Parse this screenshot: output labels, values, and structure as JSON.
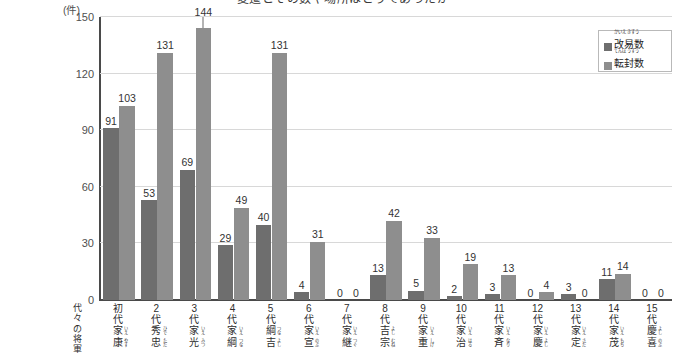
{
  "title": "変遷とその数や場所はどうであったか",
  "axis": {
    "y_unit": "(件)",
    "y_ticks": [
      "0",
      "30",
      "60",
      "90",
      "120",
      "150"
    ],
    "x_axis_name_lines": [
      "代々の将軍"
    ]
  },
  "legend": {
    "items": [
      {
        "ruby": "かいえきすう",
        "label": "改易数",
        "color": "#6e6e6e"
      },
      {
        "ruby": "てんぽうすう",
        "label": "転封数",
        "color": "#8e8e8e"
      }
    ]
  },
  "chart_data": {
    "type": "bar",
    "title": "変遷とその数や場所はどうであったか",
    "xlabel": "代々の将軍",
    "ylabel": "(件)",
    "ylim": [
      0,
      150
    ],
    "yticks": [
      0,
      30,
      60,
      90,
      120,
      150
    ],
    "grid": true,
    "legend_position": "top-right",
    "categories": [
      "初代 家康",
      "2代 秀忠",
      "3代 家光",
      "4代 家綱",
      "5代 綱吉",
      "6代 家宣",
      "7代 家継",
      "8代 吉宗",
      "9代 家重",
      "10代 家治",
      "11代 家斉",
      "12代 家慶",
      "13代 家定",
      "14代 家茂",
      "15代 慶喜"
    ],
    "category_details": [
      {
        "gen": "初代",
        "gen_ruby": "しょだい",
        "name": "家康",
        "name_ruby": "いえやす"
      },
      {
        "gen": "2代",
        "gen_ruby": "だい",
        "name": "秀忠",
        "name_ruby": "ひでただ"
      },
      {
        "gen": "3代",
        "gen_ruby": "だい",
        "name": "家光",
        "name_ruby": "いえみつ"
      },
      {
        "gen": "4代",
        "gen_ruby": "だい",
        "name": "家綱",
        "name_ruby": "いえつな"
      },
      {
        "gen": "5代",
        "gen_ruby": "だい",
        "name": "綱吉",
        "name_ruby": "つなよし"
      },
      {
        "gen": "6代",
        "gen_ruby": "だい",
        "name": "家宣",
        "name_ruby": "いえのぶ"
      },
      {
        "gen": "7代",
        "gen_ruby": "だい",
        "name": "家継",
        "name_ruby": "いえつぐ"
      },
      {
        "gen": "8代",
        "gen_ruby": "だい",
        "name": "吉宗",
        "name_ruby": "よしむね"
      },
      {
        "gen": "9代",
        "gen_ruby": "だい",
        "name": "家重",
        "name_ruby": "いえしげ"
      },
      {
        "gen": "10代",
        "gen_ruby": "だい",
        "name": "家治",
        "name_ruby": "いえはる"
      },
      {
        "gen": "11代",
        "gen_ruby": "だい",
        "name": "家斉",
        "name_ruby": "いえなり"
      },
      {
        "gen": "12代",
        "gen_ruby": "だい",
        "name": "家慶",
        "name_ruby": "いえよし"
      },
      {
        "gen": "13代",
        "gen_ruby": "だい",
        "name": "家定",
        "name_ruby": "いえさだ"
      },
      {
        "gen": "14代",
        "gen_ruby": "だい",
        "name": "家茂",
        "name_ruby": "いえもち"
      },
      {
        "gen": "15代",
        "gen_ruby": "だい",
        "name": "慶喜",
        "name_ruby": "よしのぶ"
      }
    ],
    "series": [
      {
        "name": "改易数",
        "color": "#6e6e6e",
        "values": [
          91,
          53,
          69,
          29,
          40,
          4,
          0,
          13,
          5,
          2,
          3,
          0,
          3,
          11,
          0
        ]
      },
      {
        "name": "転封数",
        "color": "#8e8e8e",
        "values": [
          103,
          131,
          144,
          49,
          131,
          31,
          0,
          42,
          33,
          19,
          13,
          4,
          0,
          14,
          0
        ]
      }
    ]
  }
}
